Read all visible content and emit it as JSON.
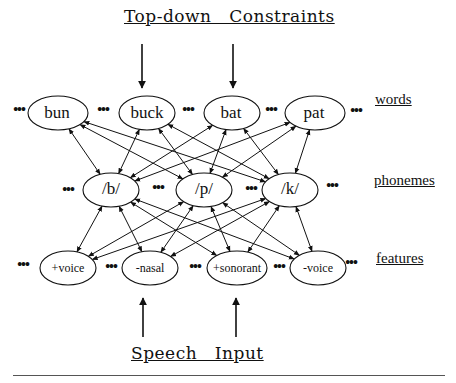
{
  "titles": {
    "top": "Top-down   Constraints",
    "bottom": "Speech   Input"
  },
  "level_labels": {
    "words": "words",
    "phonemes": "phonemes",
    "features": "features"
  },
  "ellipsis": "•••",
  "nodes": {
    "words": [
      "bun",
      "buck",
      "bat",
      "pat"
    ],
    "phonemes": [
      "/b/",
      "/p/",
      "/k/"
    ],
    "features": [
      "+voice",
      "-nasal",
      "+sonorant",
      "-voice"
    ]
  },
  "connections": {
    "word_phoneme": "bidirectional, every word connected to every phoneme",
    "phoneme_feature": "bidirectional, every phoneme connected to every feature"
  }
}
